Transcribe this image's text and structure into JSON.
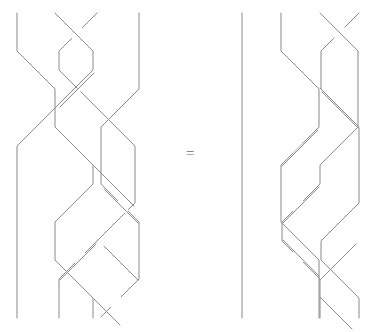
{
  "figure": {
    "type": "braid-equivalence",
    "background_color": "#ffffff",
    "stroke_color": "#8a8a8a",
    "stroke_width": 1,
    "canvas": {
      "width": 380,
      "height": 332
    }
  },
  "relation": {
    "symbol": "=",
    "x": 190,
    "y": 154
  },
  "braids": [
    {
      "name": "left-braid",
      "strand_count": 4,
      "columns": [
        17,
        55,
        97,
        139
      ],
      "top_y": 13,
      "bottom_y": 318,
      "row_height": 38,
      "crossings": [
        {
          "row": 0,
          "position": 2,
          "over": "left-over-right"
        },
        {
          "row": 1,
          "position": 1,
          "over": "left-over-right"
        },
        {
          "row": 2,
          "position": 2,
          "over": "right-over-left"
        },
        {
          "row": 3,
          "position": 1,
          "over": "left-over-right"
        },
        {
          "row": 4,
          "position": 2,
          "over": "left-over-right"
        },
        {
          "row": 5,
          "position": 3,
          "over": "right-over-left"
        },
        {
          "row": 6,
          "position": 2,
          "over": "left-over-right"
        },
        {
          "row": 7,
          "position": 3,
          "over": "right-over-left"
        },
        {
          "row": 8,
          "position": 3,
          "over": "left-over-right"
        }
      ]
    },
    {
      "name": "right-braid",
      "strand_count": 4,
      "columns": [
        242,
        281,
        320,
        359
      ],
      "top_y": 13,
      "bottom_y": 318,
      "row_height": 38,
      "crossings": [
        {
          "row": 0,
          "position": 3,
          "over": "left-over-right"
        },
        {
          "row": 1,
          "position": 2,
          "over": "right-over-left"
        },
        {
          "row": 2,
          "position": 2,
          "over": "left-over-right"
        },
        {
          "row": 3,
          "position": 3,
          "over": "right-over-left"
        },
        {
          "row": 4,
          "position": 2,
          "over": "left-over-right"
        },
        {
          "row": 5,
          "position": 1,
          "over": "left-over-right"
        },
        {
          "row": 6,
          "position": 2,
          "over": "right-over-left"
        },
        {
          "row": 7,
          "position": 1,
          "over": "left-over-right"
        },
        {
          "row": 8,
          "position": 2,
          "over": "left-over-right"
        }
      ]
    }
  ],
  "geometry": {
    "left_paths": [
      "M17,13 L17,51 L55,89 L55,108 L17,146 L17,318",
      "M55,13 L93,51 L93,70 L55,108 L55,127 L93,165 L93,184 L55,222 L55,260 L93,298 L93,318",
      "M97,13 L59,51 L59,70 L97,108 L135,146 L135,203 L97,241 L59,279 L59,318",
      "M139,13 L139,89 L101,127 L101,184 L139,222 L139,279 L101,317"
    ],
    "left_overpass_segments": [
      "M57,51 L78,30",
      "M19,51 L40,72",
      "M61,108 L78,91",
      "M19,146 L40,125",
      "M99,165 L119,145",
      "M137,222 L118,203",
      "M99,241 L76,264",
      "M137,279 L116,258",
      "M103,317 L122,298"
    ],
    "right_paths": [
      "M242,13 L242,318",
      "M281,13 L281,51 L319,89 L319,127 L281,165 L281,222 L319,260 L319,318",
      "M320,13 L358,51 L358,127 L320,165 L320,184 L282,222 L282,241 L320,279 L320,318",
      "M359,13 L321,51 L321,89 L359,127 L359,203 L321,241 L321,260 L359,298 L359,318"
    ],
    "right_overpass_segments": [
      "M322,51 L343,30",
      "M321,89 L341,109",
      "M283,165 L302,146",
      "M357,127 L338,108",
      "M284,222 L303,203",
      "M284,241 L303,260",
      "M357,203 L338,222",
      "M322,279 L341,260",
      "M322,298 L341,317"
    ]
  }
}
